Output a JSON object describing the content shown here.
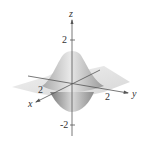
{
  "figure": {
    "type": "3d-surface-plot",
    "axes": {
      "z": {
        "label": "z",
        "ticks": [
          "2",
          "-2"
        ]
      },
      "x": {
        "label": "x",
        "ticks": [
          "2"
        ]
      },
      "y": {
        "label": "y",
        "ticks": [
          "2"
        ]
      }
    },
    "colors": {
      "surface_light": "#e6e6e6",
      "surface_mid": "#bdbdbd",
      "surface_dark": "#8a8a8a",
      "axis": "#555555"
    }
  }
}
